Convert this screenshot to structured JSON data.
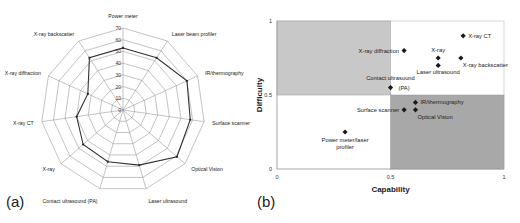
{
  "figure": {
    "panel_a_label": "(a)",
    "panel_b_label": "(b)"
  },
  "chart_data": [
    {
      "type": "radar",
      "panel": "(a)",
      "title": "",
      "categories": [
        "Power meter",
        "Laser beam profiler",
        "IR/thermography",
        "Surface scanner",
        "Optical Vision",
        "Laser ultrasound",
        "Contact ultrasound (PA)",
        "X-ray",
        "X-ray CT",
        "X-ray diffraction",
        "X-ray backscatter"
      ],
      "values": [
        53,
        53,
        60,
        58,
        61,
        49,
        46,
        45,
        40,
        33,
        53
      ],
      "radial_ticks": [
        0,
        10,
        20,
        30,
        40,
        50,
        60,
        70
      ],
      "rlim": [
        0,
        70
      ],
      "grid": true,
      "legend": null
    },
    {
      "type": "scatter",
      "panel": "(b)",
      "title": "",
      "xlabel": "Capability",
      "ylabel": "Difficulty",
      "xlim": [
        0,
        1
      ],
      "ylim": [
        0,
        1
      ],
      "xticks": [
        "0",
        "0.5",
        "1"
      ],
      "yticks": [
        "0",
        "0.5",
        "1"
      ],
      "quadrants": [
        {
          "x": [
            0,
            0.5
          ],
          "y": [
            0.5,
            1
          ],
          "fill": "#c8c8c8"
        },
        {
          "x": [
            0.5,
            1
          ],
          "y": [
            0,
            0.5
          ],
          "fill": "#a8a8a8"
        }
      ],
      "points": [
        {
          "label": "X-ray CT",
          "x": 0.82,
          "y": 0.9,
          "label_pos": "right"
        },
        {
          "label": "X-ray diffraction",
          "x": 0.56,
          "y": 0.8,
          "label_pos": "left"
        },
        {
          "label": "X-ray",
          "x": 0.71,
          "y": 0.75,
          "label_pos": "above"
        },
        {
          "label": "X-ray backscatter",
          "x": 0.81,
          "y": 0.75,
          "label_pos": "below-right"
        },
        {
          "label": "Laser ultrasound",
          "x": 0.71,
          "y": 0.7,
          "label_pos": "below"
        },
        {
          "label": "Contact ultrasound (PA)",
          "x": 0.5,
          "y": 0.55,
          "label_pos": "above"
        },
        {
          "label": "IR/thermography",
          "x": 0.61,
          "y": 0.45,
          "label_pos": "right"
        },
        {
          "label": "Surface scanner",
          "x": 0.56,
          "y": 0.4,
          "label_pos": "left"
        },
        {
          "label": "Optical Vision",
          "x": 0.61,
          "y": 0.4,
          "label_pos": "below-right"
        },
        {
          "label": "Power meter/laser profiler",
          "x": 0.3,
          "y": 0.25,
          "label_pos": "below"
        }
      ],
      "grid": false,
      "legend": null
    }
  ]
}
